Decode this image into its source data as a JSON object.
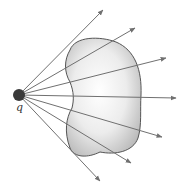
{
  "diagram": {
    "charge": {
      "label": "q",
      "cx": 19,
      "cy": 95,
      "r": 6,
      "color": "#3a3a3a"
    },
    "surface": {
      "fill_inner": "#ffffff",
      "fill_outer": "#bdbdbd",
      "stroke": "#555555"
    },
    "field_line_color": "#707070",
    "field_lines": [
      {
        "x2": 103,
        "y2": 10
      },
      {
        "x2": 135,
        "y2": 28
      },
      {
        "x2": 166,
        "y2": 58
      },
      {
        "x2": 176,
        "y2": 98
      },
      {
        "x2": 162,
        "y2": 137
      },
      {
        "x2": 131,
        "y2": 163
      },
      {
        "x2": 100,
        "y2": 181
      }
    ]
  }
}
